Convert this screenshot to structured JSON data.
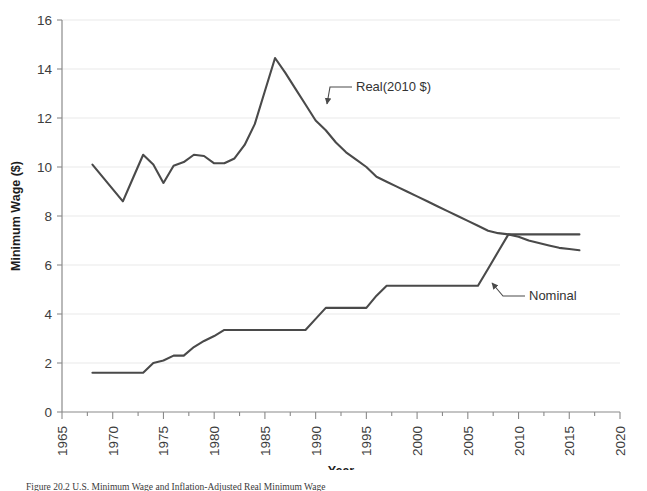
{
  "chart_data": {
    "type": "line",
    "title": "",
    "xlabel": "Year",
    "ylabel": "Minimum Wage ($)",
    "xlim": [
      1965,
      2020
    ],
    "ylim": [
      0,
      16
    ],
    "xticks": [
      1965,
      1970,
      1975,
      1980,
      1985,
      1990,
      1995,
      2000,
      2005,
      2010,
      2015,
      2020
    ],
    "xtick_labels": [
      "1965",
      "1970",
      "1975",
      "1980",
      "1985",
      "1990",
      "1995",
      "2000",
      "2005",
      "2010",
      "2015",
      "2020"
    ],
    "yticks": [
      0,
      2,
      4,
      6,
      8,
      10,
      12,
      14,
      16
    ],
    "ytick_labels": [
      "0",
      "2",
      "4",
      "6",
      "8",
      "10",
      "12",
      "14",
      "16"
    ],
    "minor_xtick_interval": 2.5,
    "grid": "horizontal-only",
    "legend_position": "inline-annotations",
    "line_color": "#4a4a4a",
    "grid_color": "#e9e9e9",
    "axis_color": "#8a8a8a",
    "series": [
      {
        "name": "Real(2010 $)",
        "annotation_label": "Real(2010 $)",
        "x": [
          1968,
          1969,
          1970,
          1971,
          1972,
          1973,
          1974,
          1975,
          1976,
          1977,
          1978,
          1979,
          1980,
          1981,
          1982,
          1983,
          1984,
          1985,
          1986,
          1987,
          1988,
          1989,
          1990,
          1991,
          1992,
          1993,
          1994,
          1995,
          1996,
          1997,
          1998,
          1999,
          2000,
          2001,
          2002,
          2003,
          2004,
          2005,
          2006,
          2007,
          2008,
          2009,
          2010,
          2011,
          2012,
          2013,
          2014,
          2015,
          2016
        ],
        "values": [
          10.1,
          9.6,
          9.1,
          8.6,
          9.55,
          10.5,
          10.1,
          9.35,
          10.05,
          10.2,
          10.5,
          10.45,
          10.15,
          10.15,
          10.35,
          10.9,
          11.75,
          13.1,
          14.45,
          13.85,
          13.2,
          12.55,
          11.9,
          11.5,
          11.0,
          10.6,
          10.3,
          10.0,
          9.6,
          9.4,
          9.2,
          9.0,
          8.8,
          8.6,
          8.4,
          8.2,
          8.0,
          7.8,
          7.6,
          7.4,
          7.3,
          7.25,
          7.15,
          7.0,
          6.9,
          6.8,
          6.7,
          6.65,
          6.6
        ]
      },
      {
        "name": "Nominal",
        "annotation_label": "Nominal",
        "x": [
          1968,
          1969,
          1970,
          1971,
          1972,
          1973,
          1974,
          1975,
          1976,
          1977,
          1978,
          1979,
          1980,
          1981,
          1982,
          1983,
          1984,
          1985,
          1986,
          1987,
          1988,
          1989,
          1990,
          1991,
          1992,
          1993,
          1994,
          1995,
          1996,
          1997,
          1998,
          1999,
          2000,
          2001,
          2002,
          2003,
          2004,
          2005,
          2006,
          2007,
          2008,
          2009,
          2010,
          2011,
          2012,
          2013,
          2014,
          2015,
          2016
        ],
        "values": [
          1.6,
          1.6,
          1.6,
          1.6,
          1.6,
          1.6,
          2.0,
          2.1,
          2.3,
          2.3,
          2.65,
          2.9,
          3.1,
          3.35,
          3.35,
          3.35,
          3.35,
          3.35,
          3.35,
          3.35,
          3.35,
          3.35,
          3.8,
          4.25,
          4.25,
          4.25,
          4.25,
          4.25,
          4.75,
          5.15,
          5.15,
          5.15,
          5.15,
          5.15,
          5.15,
          5.15,
          5.15,
          5.15,
          5.15,
          5.85,
          6.55,
          7.25,
          7.25,
          7.25,
          7.25,
          7.25,
          7.25,
          7.25,
          7.25
        ]
      }
    ],
    "annotations": [
      {
        "label": "Real(2010 $)",
        "text_x": 352,
        "text_y": 91,
        "arrow_tip_x": 327,
        "arrow_tip_y": 104
      },
      {
        "label": "Nominal",
        "text_x": 525,
        "text_y": 300,
        "arrow_tip_x": 492,
        "arrow_tip_y": 283
      }
    ]
  },
  "caption": {
    "text": "Figure 20.2 U.S. Minimum Wage and Inflation-Adjusted Real Minimum Wage"
  }
}
